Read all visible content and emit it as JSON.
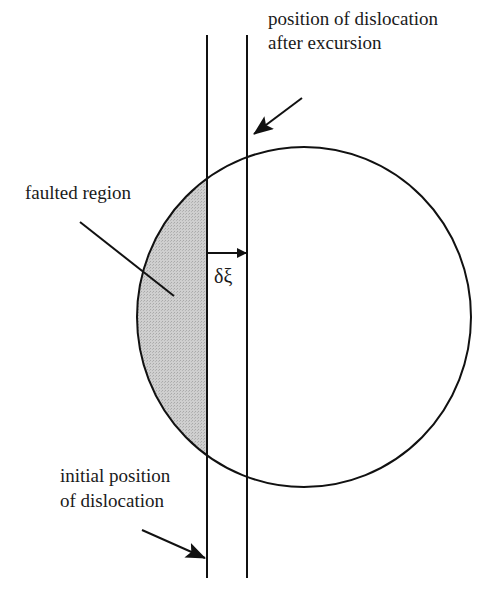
{
  "diagram": {
    "labels": {
      "after_line1": "position of dislocation",
      "after_line2": "after excursion",
      "faulted": "faulted region",
      "displacement": "δξ",
      "initial_line1": "initial position",
      "initial_line2": "of dislocation"
    },
    "colors": {
      "stroke": "#111111",
      "faulted_fill": "#c8c8c8",
      "background": "#ffffff"
    },
    "geometry": {
      "circle": {
        "cx": 304,
        "cy": 317,
        "rx": 167,
        "ry": 170
      },
      "initial_line_x": 207,
      "after_line_x": 247,
      "lines_y": [
        35,
        578
      ]
    }
  }
}
